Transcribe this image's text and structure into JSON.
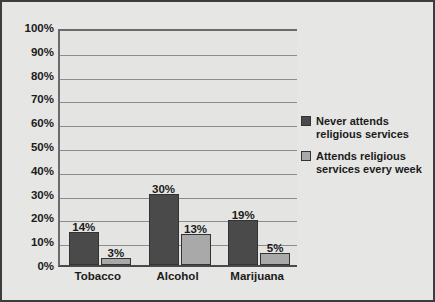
{
  "chart_data": {
    "type": "bar",
    "title": "",
    "subtitle": "",
    "xlabel": "",
    "ylabel": "",
    "categories": [
      "Tobacco",
      "Alcohol",
      "Marijuana"
    ],
    "series": [
      {
        "name": "Never attends religious services",
        "color": "#4a4a4a",
        "values": [
          14,
          30,
          19
        ],
        "value_labels": [
          "14%",
          "30%",
          "19%"
        ]
      },
      {
        "name": "Attends religious services every week",
        "color": "#a9a9a9",
        "values": [
          3,
          13,
          5
        ],
        "value_labels": [
          "3%",
          "13%",
          "5%"
        ]
      }
    ],
    "ylim": [
      0,
      100
    ],
    "ytick_values": [
      100,
      90,
      80,
      70,
      60,
      50,
      40,
      30,
      20,
      10,
      0
    ],
    "ytick_labels": [
      "100%",
      "90%",
      "80%",
      "70%",
      "60%",
      "50%",
      "40%",
      "30%",
      "20%",
      "10%",
      "0%"
    ],
    "grid": true,
    "legend_position": "right",
    "legend": [
      {
        "label_line1": "Never attends",
        "label_line2": "religious services",
        "color": "#4a4a4a"
      },
      {
        "label_line1": "Attends religious",
        "label_line2": "services every week",
        "color": "#a9a9a9"
      }
    ]
  },
  "colors": {
    "figure_background": "#e6e6e4",
    "plot_background": "#e4e4e2",
    "gridline": "#8c8c8c",
    "axis": "#4a4a4a",
    "border": "#3d3d3d",
    "text": "#1b1b1b",
    "series_dark": "#4a4a4a",
    "series_light": "#a9a9a9"
  }
}
